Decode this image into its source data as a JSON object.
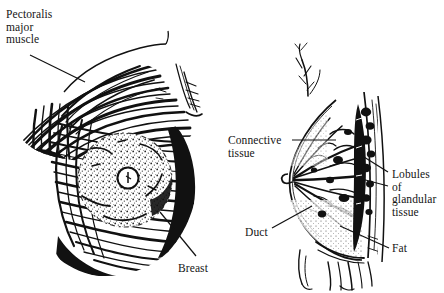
{
  "image": {
    "kind": "anatomical-illustration",
    "subject": "Breast anatomy",
    "background_color": "#ffffff",
    "ink_color": "#111111",
    "style": "black-and-white engraved line drawing"
  },
  "figures": [
    {
      "id": "anterior-view",
      "caption_labels": [
        "pectoralis",
        "breast"
      ],
      "description": "Anterior view of chest showing radiating pectoralis major muscle fibers and the breast with areola and nipple"
    },
    {
      "id": "sagittal-section",
      "caption_labels": [
        "connective",
        "lobules",
        "duct",
        "fat"
      ],
      "description": "Sagittal cross-section of breast showing connective tissue, ducts, lobules of glandular tissue and fat against the chest wall"
    }
  ],
  "labels": {
    "pectoralis": {
      "lines": [
        "Pectoralis",
        "major",
        "muscle"
      ],
      "text": "Pectoralis\nmajor\nmuscle"
    },
    "breast": {
      "lines": [
        "Breast"
      ],
      "text": "Breast"
    },
    "connective": {
      "lines": [
        "Connective",
        "tissue"
      ],
      "text": "Connective\ntissue"
    },
    "lobules": {
      "lines": [
        "Lobules",
        "of",
        "glandular",
        "tissue"
      ],
      "text": "Lobules\nof\nglandular\ntissue"
    },
    "duct": {
      "lines": [
        "Duct"
      ],
      "text": "Duct"
    },
    "fat": {
      "lines": [
        "Fat"
      ],
      "text": "Fat"
    }
  }
}
